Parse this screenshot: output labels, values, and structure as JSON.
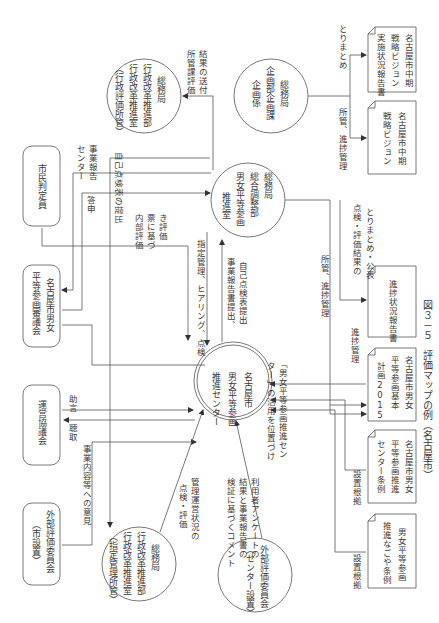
{
  "caption": "図３－５　評価マップの例（名古屋市）",
  "nodes": {
    "center": [
      "名古屋市",
      "男女平等参画",
      "推進センター"
    ],
    "somu_gender": [
      "総務局",
      "総合調整部",
      "男女平等参画",
      "推進室"
    ],
    "somu_gyosei_top": [
      "総務局",
      "行政改革推進部",
      "行政改革推進室",
      "（行政評価所管）"
    ],
    "somu_kikaku": [
      "総務局",
      "企画部企画課",
      "企画係"
    ],
    "somu_gyosei_bottom": [
      "総務局",
      "行政改革推進部",
      "行政改革推進室",
      "（指定管理所管）"
    ],
    "external_center": [
      "外部評価委員会",
      "（センター設置）"
    ],
    "shimin_hanteiin": [
      "市民判定員"
    ],
    "shingikai": [
      "名古屋市男女",
      "平等参画審議会"
    ],
    "unei_kyogikai": [
      "運営協議会"
    ],
    "external_city": [
      "外部評価委員会",
      "（市設置）"
    ]
  },
  "documents": {
    "vision": [
      "名古屋市中期",
      "戦略ビジョン"
    ],
    "vision_report": [
      "名古屋市中期",
      "戦略ビジョン",
      "実施状況報告書"
    ],
    "progress_report": [
      "進捗状況報告書"
    ],
    "basic_plan": [
      "名古屋市男女",
      "平等参画基本",
      "計画2015"
    ],
    "center_ordinance": [
      "名古屋市男女",
      "平等参画推進",
      "センター条例"
    ],
    "promotion_ordinance": [
      "男女平等参画",
      "推進なごや条例"
    ]
  },
  "edge_labels": {
    "shokan_hyoka_soufu": [
      "所管課評価",
      "結果の送付"
    ],
    "torimatome": [
      "とりまとめ"
    ],
    "shokan_shincho_top": [
      "所管、進捗管理"
    ],
    "jiko_tenken": [
      "自己点検表の提出"
    ],
    "center_jigyo_hokoku": [
      "センター",
      "事業報告"
    ],
    "toushin": [
      "答申"
    ],
    "naibu_hyoka": [
      "内部評価",
      "票に基づ",
      "き評価"
    ],
    "shitei_kanri": [
      "指定管理、ヒアリング、点検"
    ],
    "jigyo_hokokusho": [
      "事業報告書提出、",
      "自己点検表提出"
    ],
    "tenken_kohyo": [
      "点検・評価結果の",
      "とりまとめ・公表"
    ],
    "shokan_shincho_mid": [
      "所管、進捗管理"
    ],
    "shincho_kanri": [
      "進捗管理"
    ],
    "katsuyo": [
      "「男女平等参画推進セン",
      "ター」の活用を位置づけ"
    ],
    "jogen": [
      "助言"
    ],
    "chosyu": [
      "聴取"
    ],
    "jigyo_iken": [
      "事業内容等への意見"
    ],
    "kanri_unei": [
      "管理運営状況の",
      "点検・評価"
    ],
    "riyosha_survey": [
      "利用者アンケートの",
      "結果と事業報告書の",
      "検証に基づくコメント"
    ],
    "setchi_konkyo_1": [
      "設置根拠"
    ],
    "setchi_konkyo_2": [
      "設置根拠"
    ]
  }
}
